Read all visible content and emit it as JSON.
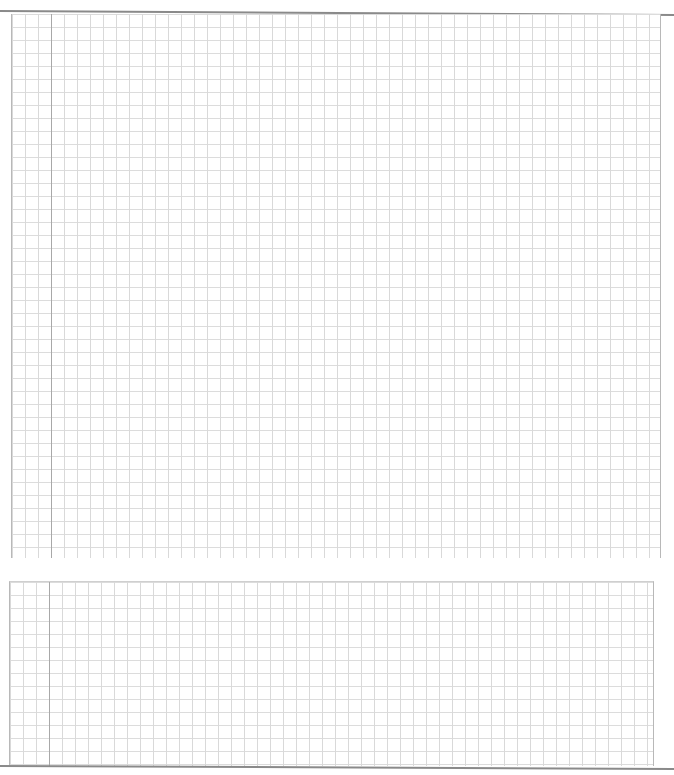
{
  "document": {
    "type": "graph-paper-worksheet",
    "grid_blocks": [
      {
        "id": "upper",
        "cell_size_px": 13,
        "line_color": "#d9d9d9",
        "margin_line_color": "#a8a8a8"
      },
      {
        "id": "lower",
        "cell_size_px": 13,
        "line_color": "#d9d9d9",
        "margin_line_color": "#a8a8a8"
      }
    ],
    "text": []
  }
}
